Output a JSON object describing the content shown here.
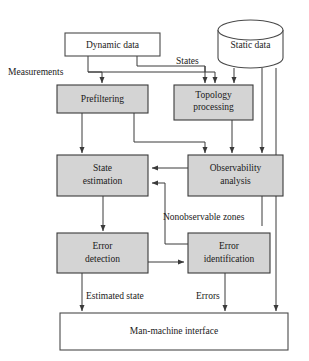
{
  "diagram": {
    "colors": {
      "process_fill": "#d4d4d4",
      "data_fill": "#ffffff",
      "stroke": "#3a3a3a",
      "background": "#ffffff",
      "text": "#1a1a1a"
    },
    "nodes": [
      {
        "id": "dynamic-data",
        "label": "Dynamic data",
        "shape": "rect",
        "style": "white",
        "x": 65,
        "y": 33,
        "w": 95,
        "h": 23,
        "lines": [
          "Dynamic data"
        ]
      },
      {
        "id": "static-data",
        "label": "Static data",
        "shape": "cylinder",
        "style": "white",
        "x": 218,
        "y": 20,
        "w": 65,
        "h": 48,
        "lines": [
          "Static data"
        ]
      },
      {
        "id": "prefiltering",
        "label": "Prefiltering",
        "shape": "rect",
        "style": "gray",
        "x": 57,
        "y": 85,
        "w": 91,
        "h": 28,
        "lines": [
          "Prefiltering"
        ]
      },
      {
        "id": "topology-processing",
        "label": "Topology processing",
        "shape": "rect",
        "style": "gray",
        "x": 174,
        "y": 85,
        "w": 79,
        "h": 35,
        "lines": [
          "Topology",
          "processing"
        ]
      },
      {
        "id": "state-estimation",
        "label": "State estimation",
        "shape": "rect",
        "style": "gray",
        "x": 57,
        "y": 155,
        "w": 91,
        "h": 41,
        "lines": [
          "State",
          "estimation"
        ]
      },
      {
        "id": "observability-analysis",
        "label": "Observability analysis",
        "shape": "rect",
        "style": "gray",
        "x": 188,
        "y": 155,
        "w": 95,
        "h": 41,
        "lines": [
          "Observability",
          "analysis"
        ]
      },
      {
        "id": "error-detection",
        "label": "Error detection",
        "shape": "rect",
        "style": "gray",
        "x": 57,
        "y": 233,
        "w": 91,
        "h": 40,
        "lines": [
          "Error",
          "detection"
        ]
      },
      {
        "id": "error-identification",
        "label": "Error identification",
        "shape": "rect",
        "style": "gray",
        "x": 188,
        "y": 233,
        "w": 82,
        "h": 40,
        "lines": [
          "Error",
          "identification"
        ]
      },
      {
        "id": "man-machine-interface",
        "label": "Man-machine interface",
        "shape": "rect",
        "style": "white",
        "x": 60,
        "y": 313,
        "w": 228,
        "h": 37,
        "lines": [
          "Man-machine interface"
        ]
      }
    ],
    "edge_labels": [
      {
        "id": "measurements",
        "text": "Measurements",
        "x": 8,
        "y": 73,
        "anchor": "start"
      },
      {
        "id": "states",
        "text": "States",
        "x": 176,
        "y": 62,
        "anchor": "start"
      },
      {
        "id": "nonobservable-zones",
        "text": "Nonobservable zones",
        "x": 163,
        "y": 218,
        "anchor": "start"
      },
      {
        "id": "estimated-state",
        "text": "Estimated state",
        "x": 86,
        "y": 297,
        "anchor": "start"
      },
      {
        "id": "errors",
        "text": "Errors",
        "x": 196,
        "y": 297,
        "anchor": "start"
      }
    ],
    "edges": [
      {
        "id": "dynamic-to-prefiltering",
        "from": "dynamic-data",
        "to": "prefiltering"
      },
      {
        "id": "dynamic-to-topology",
        "from": "dynamic-data",
        "to": "topology-processing"
      },
      {
        "id": "static-to-topology",
        "from": "static-data",
        "to": "topology-processing"
      },
      {
        "id": "static-to-observability",
        "from": "static-data",
        "to": "observability-analysis"
      },
      {
        "id": "static-to-interface",
        "from": "static-data",
        "to": "man-machine-interface"
      },
      {
        "id": "prefiltering-to-state-estimation",
        "from": "prefiltering",
        "to": "state-estimation"
      },
      {
        "id": "prefiltering-to-observability",
        "from": "prefiltering",
        "to": "observability-analysis"
      },
      {
        "id": "topology-to-observability",
        "from": "topology-processing",
        "to": "observability-analysis"
      },
      {
        "id": "observability-to-state-estimation",
        "from": "observability-analysis",
        "to": "state-estimation"
      },
      {
        "id": "state-estimation-to-error-detection",
        "from": "state-estimation",
        "to": "error-detection"
      },
      {
        "id": "error-detection-to-error-identification",
        "from": "error-detection",
        "to": "error-identification"
      },
      {
        "id": "error-identification-to-state-estimation",
        "from": "error-identification",
        "to": "state-estimation"
      },
      {
        "id": "error-detection-to-interface",
        "from": "error-detection",
        "to": "man-machine-interface"
      },
      {
        "id": "error-identification-to-interface",
        "from": "error-identification",
        "to": "man-machine-interface"
      }
    ]
  }
}
